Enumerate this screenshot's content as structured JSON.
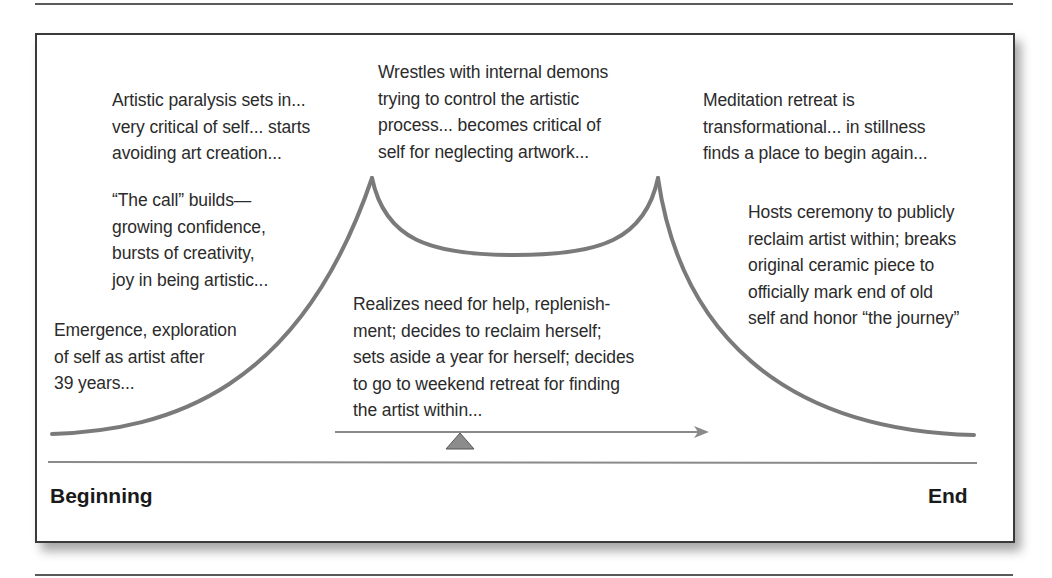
{
  "diagram": {
    "type": "story-arc / journey diagram",
    "notes": {
      "emergence": "Emergence, exploration\nof self as artist after\n39 years...",
      "the_call": "“The call” builds—\ngrowing confidence,\nbursts of creativity,\njoy in being artistic...",
      "paralysis": "Artistic paralysis sets in...\nvery critical of self... starts\navoiding art creation...",
      "demons": "Wrestles with internal demons\ntrying to control the artistic\nprocess... becomes critical of\nself for neglecting artwork...",
      "realizes": "Realizes need for help, replenish-\nment; decides to reclaim herself;\nsets aside a year for herself; decides\nto go to weekend retreat for finding\nthe artist within...",
      "meditation": "Meditation retreat is\ntransformational... in stillness\nfinds a place to begin again...",
      "ceremony": "Hosts ceremony to publicly\nreclaim artist within; breaks\noriginal ceramic piece to\nofficially mark end of old\nself and honor “the journey”"
    },
    "timeline": {
      "start_label": "Beginning",
      "end_label": "End"
    },
    "colors": {
      "curve": "#7a7a7a",
      "arrow": "#8a8a8a",
      "fulcrum": "#8c8c8c",
      "baseline": "#8a8a8a",
      "frame": "#3a3a3a",
      "text": "#2b2b2b"
    }
  }
}
